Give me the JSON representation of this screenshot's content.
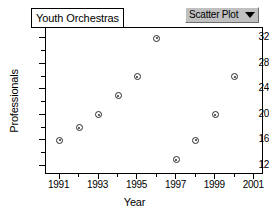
{
  "window": {
    "title_box_label": "Youth Orchestras",
    "ghost_strip_text": "",
    "plot_type_selector": {
      "value": "Scatter Plot",
      "arrow_icon": "chevron-down-icon",
      "options": [
        "Scatter Plot"
      ]
    }
  },
  "chart_data": {
    "type": "scatter",
    "title": "Youth Orchestras",
    "xlabel": "Year",
    "ylabel": "Professionals",
    "x": [
      1991,
      1992,
      1993,
      1994,
      1995,
      1996,
      1997,
      1998,
      1999,
      2000
    ],
    "values": [
      16,
      18,
      20,
      23,
      26,
      32,
      13,
      16,
      20,
      26
    ],
    "points": [
      {
        "x": 1991,
        "y": 16
      },
      {
        "x": 1992,
        "y": 18
      },
      {
        "x": 1993,
        "y": 20
      },
      {
        "x": 1994,
        "y": 23
      },
      {
        "x": 1995,
        "y": 26
      },
      {
        "x": 1996,
        "y": 32
      },
      {
        "x": 1997,
        "y": 13
      },
      {
        "x": 1998,
        "y": 16
      },
      {
        "x": 1999,
        "y": 20
      },
      {
        "x": 2000,
        "y": 26
      }
    ],
    "xticks": [
      1991,
      1993,
      1995,
      1997,
      1999,
      2001
    ],
    "xminor_ticks": [
      1992,
      1994,
      1996,
      1998,
      2000
    ],
    "yticks": [
      12,
      16,
      20,
      24,
      28,
      32
    ],
    "yminor_ticks": [
      14,
      18,
      22,
      26,
      30
    ],
    "xlim": [
      1990.3,
      2001.5
    ],
    "ylim": [
      10.6,
      33.6
    ],
    "grid": false,
    "legend": null,
    "marker_color": "#2b2b2b",
    "marker_fill": "#ffffff"
  }
}
